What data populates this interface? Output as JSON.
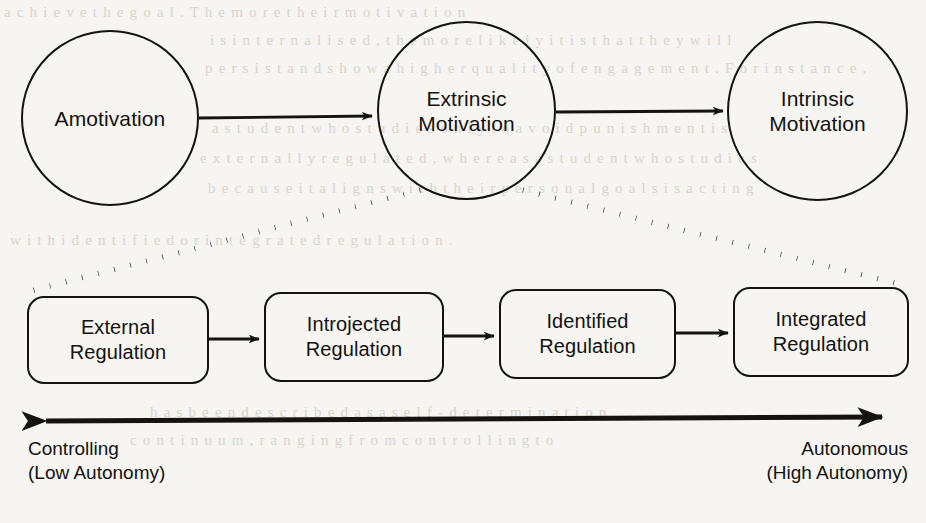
{
  "figure": {
    "stroke_color": "#14130f",
    "background_color": "#f6f5f2"
  },
  "top_row": {
    "nodes": [
      {
        "id": "amotivation",
        "label": "Amotivation"
      },
      {
        "id": "extrinsic-motivation",
        "label": "Extrinsic\nMotivation"
      },
      {
        "id": "intrinsic-motivation",
        "label": "Intrinsic\nMotivation"
      }
    ],
    "connectors": [
      {
        "from": "amotivation",
        "to": "extrinsic-motivation",
        "style": "solid-arrow"
      },
      {
        "from": "extrinsic-motivation",
        "to": "intrinsic-motivation",
        "style": "solid-arrow"
      }
    ]
  },
  "expansion": {
    "source": "extrinsic-motivation",
    "style": "dotted",
    "description": "dotted guides fanning from Extrinsic Motivation to the regulation row"
  },
  "regulation_row": {
    "boxes": [
      {
        "id": "external-regulation",
        "label": "External\nRegulation"
      },
      {
        "id": "introjected-regulation",
        "label": "Introjected\nRegulation"
      },
      {
        "id": "identified-regulation",
        "label": "Identified\nRegulation"
      },
      {
        "id": "integrated-regulation",
        "label": "Integrated\nRegulation"
      }
    ],
    "connectors": [
      {
        "from": "external-regulation",
        "to": "introjected-regulation",
        "style": "solid-arrow"
      },
      {
        "from": "introjected-regulation",
        "to": "identified-regulation",
        "style": "solid-arrow"
      },
      {
        "from": "identified-regulation",
        "to": "integrated-regulation",
        "style": "solid-arrow"
      }
    ]
  },
  "continuum_axis": {
    "style": "double-headed-arrow",
    "left_label": "Controlling\n(Low Autonomy)",
    "right_label": "Autonomous\n(High Autonomy)"
  },
  "background_bleed": {
    "lines": [
      "a c h i e v e   t h e   g o a l .  T h e  m o r e  t h e i r  m o t i v a t i o n",
      "i s   i n t e r n a l i s e d ,   t h e   m o r e   l i k e l y   i t   i s   t h a t   t h e y   w i l l",
      "p e r s i s t   a n d   s h o w   a   h i g h e r   q u a l i t y  o f   e n g a g e m e n t .  F o r  i n s t a n c e ,",
      "a   s t u d e n t   w h o   s t u d i e s   o n l y   t o   a v o i d   p u n i s h m e n t   i s",
      "e x t e r n a l l y   r e g u l a t e d ,   w h e r e a s   a   s t u d e n t   w h o   s t u d i e s",
      "b e c a u s e   i t   a l i g n s   w i t h   t h e i r   p e r s o n a l   g o a l s   i s   a c t i n g",
      "w i t h   i d e n t i f i e d   o r   i n t e g r a t e d   r e g u l a t i o n ."
    ],
    "lower_lines": [
      "h a s   b e e n   d e s c r i b e d   a s   a   s e l f - d e t e r m i n a t i o n",
      "c o n t i n u u m ,   r a n g i n g   f r o m   c o n t r o l l i n g   t o"
    ]
  }
}
